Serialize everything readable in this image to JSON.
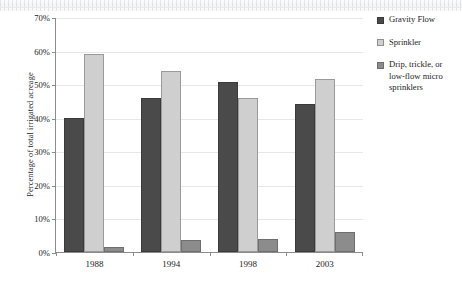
{
  "chart_data": {
    "type": "bar",
    "title": "",
    "xlabel": "",
    "ylabel": "Percentage of total irrigated acreage",
    "categories": [
      "1988",
      "1994",
      "1998",
      "2003"
    ],
    "series": [
      {
        "name": "Gravity Flow",
        "values": [
          40,
          46,
          50.5,
          44
        ],
        "color": "#4a4a4a"
      },
      {
        "name": "Sprinkler",
        "values": [
          59,
          54,
          46,
          51.5
        ],
        "color": "#cfcfcf"
      },
      {
        "name": "Drip, trickle, or low-flow micro sprinklers",
        "values": [
          1.5,
          3.5,
          4,
          6
        ],
        "color": "#8c8c8c"
      }
    ],
    "ylim": [
      0,
      70
    ],
    "yticks": [
      0,
      10,
      20,
      30,
      40,
      50,
      60,
      70
    ],
    "ytick_labels": [
      "0%",
      "10%",
      "20%",
      "30%",
      "40%",
      "50%",
      "60%",
      "70%"
    ],
    "grid": true,
    "legend_position": "right"
  },
  "legend": {
    "items": [
      {
        "label": "Gravity Flow"
      },
      {
        "label": "Sprinkler"
      },
      {
        "label_line1": "Drip, trickle, or",
        "label_line2": "low-flow micro",
        "label_line3": "sprinklers"
      }
    ]
  }
}
